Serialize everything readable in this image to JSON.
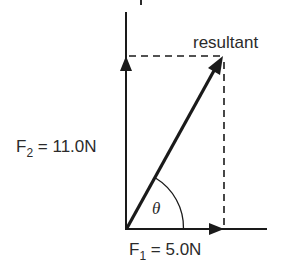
{
  "diagram": {
    "type": "vector-addition",
    "colors": {
      "line": "#1a1a1a",
      "text": "#2b2b2b",
      "background": "#ffffff"
    },
    "labels": {
      "resultant": "resultant",
      "f2_main": "F",
      "f2_sub": "2",
      "f2_value": " = 11.0N",
      "f1_main": "F",
      "f1_sub": "1",
      "f1_value": " = 5.0N",
      "angle": "θ"
    },
    "vectors": [
      {
        "name": "F1",
        "magnitude": "5.0N",
        "direction": "horizontal"
      },
      {
        "name": "F2",
        "magnitude": "11.0N",
        "direction": "vertical"
      },
      {
        "name": "resultant",
        "direction": "diagonal"
      }
    ]
  }
}
